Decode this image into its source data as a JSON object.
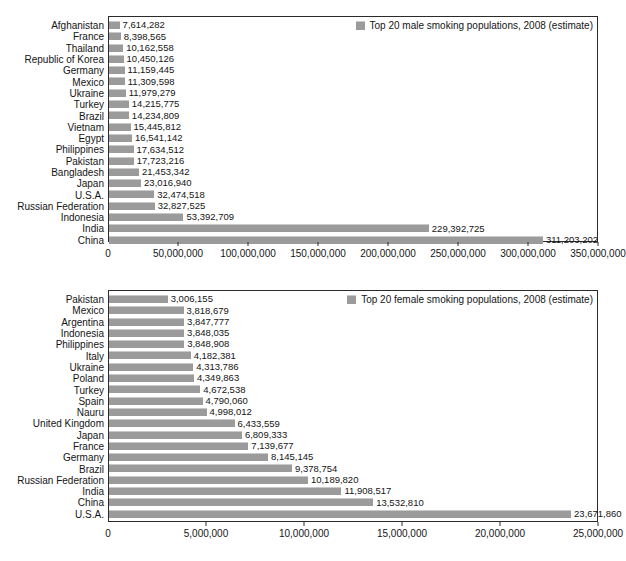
{
  "figure": {
    "background": "#ffffff",
    "bar_color": "#9b9b9b",
    "axis_color": "#2b2b2b",
    "text_color": "#141414"
  },
  "chart_data": [
    {
      "type": "bar",
      "orientation": "horizontal",
      "title": "",
      "legend_label": "Top 20 male smoking populations, 2008 (estimate)",
      "legend_position": "top-right",
      "xlabel": "",
      "ylabel": "",
      "xlim": [
        0,
        350000000
      ],
      "grid": false,
      "tick_values": [
        0,
        50000000,
        100000000,
        150000000,
        200000000,
        250000000,
        300000000,
        350000000
      ],
      "tick_labels": [
        "0",
        "50,000,000",
        "100,000,000",
        "150,000,000",
        "200,000,000",
        "250,000,000",
        "300,000,000",
        "350,000,000"
      ],
      "categories": [
        "Afghanistan",
        "France",
        "Thailand",
        "Republic of Korea",
        "Germany",
        "Mexico",
        "Ukraine",
        "Turkey",
        "Brazil",
        "Vietnam",
        "Egypt",
        "Philippines",
        "Pakistan",
        "Bangladesh",
        "Japan",
        "U.S.A.",
        "Russian Federation",
        "Indonesia",
        "India",
        "China"
      ],
      "values": [
        7614282,
        8398565,
        10162558,
        10450126,
        11159445,
        11309598,
        11979279,
        14215775,
        14234809,
        15445812,
        16541142,
        17634512,
        17723216,
        21453342,
        23016940,
        32474518,
        32827525,
        53392709,
        229392725,
        311203202
      ],
      "value_labels": [
        "7,614,282",
        "8,398,565",
        "10,162,558",
        "10,450,126",
        "11,159,445",
        "11,309,598",
        "11,979,279",
        "14,215,775",
        "14,234,809",
        "15,445,812",
        "16,541,142",
        "17,634,512",
        "17,723,216",
        "21,453,342",
        "23,016,940",
        "32,474,518",
        "32,827,525",
        "53,392,709",
        "229,392,725",
        "311,203,202"
      ]
    },
    {
      "type": "bar",
      "orientation": "horizontal",
      "title": "",
      "legend_label": "Top 20 female smoking populations, 2008 (estimate)",
      "legend_position": "top-right",
      "xlabel": "",
      "ylabel": "",
      "xlim": [
        0,
        25000000
      ],
      "grid": false,
      "tick_values": [
        0,
        5000000,
        10000000,
        15000000,
        20000000,
        25000000
      ],
      "tick_labels": [
        "0",
        "5,000,000",
        "10,000,000",
        "15,000,000",
        "20,000,000",
        "25,000,000"
      ],
      "categories": [
        "Pakistan",
        "Mexico",
        "Argentina",
        "Indonesia",
        "Philippines",
        "Italy",
        "Ukraine",
        "Poland",
        "Turkey",
        "Spain",
        "Nauru",
        "United Kingdom",
        "Japan",
        "France",
        "Germany",
        "Brazil",
        "Russian Federation",
        "India",
        "China",
        "U.S.A."
      ],
      "values": [
        3006155,
        3818679,
        3847777,
        3848035,
        3848908,
        4182381,
        4313786,
        4349863,
        4672538,
        4790060,
        4998012,
        6433559,
        6809333,
        7139677,
        8145145,
        9378754,
        10189820,
        11908517,
        13532810,
        23671860
      ],
      "value_labels": [
        "3,006,155",
        "3,818,679",
        "3,847,777",
        "3,848,035",
        "3,848,908",
        "4,182,381",
        "4,313,786",
        "4,349,863",
        "4,672,538",
        "4,790,060",
        "4,998,012",
        "6,433,559",
        "6,809,333",
        "7,139,677",
        "8,145,145",
        "9,378,754",
        "10,189,820",
        "11,908,517",
        "13,532,810",
        "23,671,860"
      ]
    }
  ]
}
